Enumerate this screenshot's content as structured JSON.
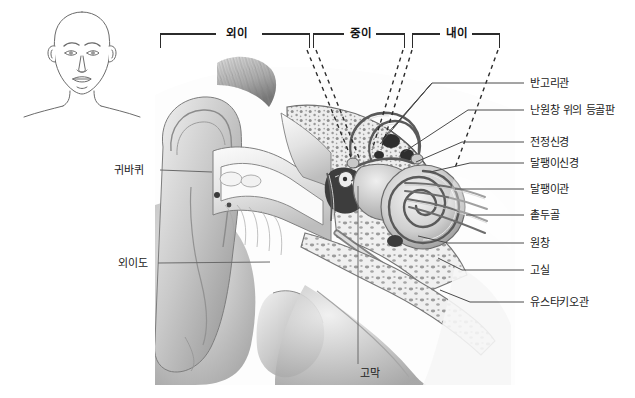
{
  "figure": {
    "title_present": false,
    "background_color": "#ffffff",
    "line_color": "#2b2b2b",
    "text_color": "#1a1a1a"
  },
  "head_inset": {
    "name": "frontal-head-outline",
    "description": "line drawing of a frontal human head, neck and shoulders"
  },
  "brackets": [
    {
      "label": "외이",
      "x_start": 160,
      "x_end": 310,
      "y": 34
    },
    {
      "label": "중이",
      "x_start": 313,
      "x_end": 405,
      "y": 34
    },
    {
      "label": "내이",
      "x_start": 412,
      "x_end": 500,
      "y": 34
    }
  ],
  "labels_left": [
    {
      "label": "귀바퀴",
      "x": 114,
      "y": 164,
      "leader_to_x": 205
    },
    {
      "label": "외이도",
      "x": 118,
      "y": 258,
      "leader_to_x": 262
    }
  ],
  "labels_right": [
    {
      "label": "반고리관",
      "y": 83
    },
    {
      "label": "난원창 위의 등골판",
      "y": 110
    },
    {
      "label": "전정신경",
      "y": 142
    },
    {
      "label": "달팽이신경",
      "y": 163
    },
    {
      "label": "달팽이관",
      "y": 189
    },
    {
      "label": "촡두골",
      "y": 215
    },
    {
      "label": "원창",
      "y": 243
    },
    {
      "label": "고실",
      "y": 270
    },
    {
      "label": "유스타키오관",
      "y": 302
    }
  ],
  "labels_bottom": [
    {
      "label": "고막",
      "x": 360,
      "y": 372
    }
  ]
}
